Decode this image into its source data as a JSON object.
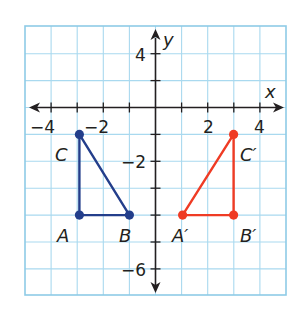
{
  "chart_data": {
    "type": "scatter",
    "title": "",
    "xlabel": "x",
    "ylabel": "y",
    "xlim": [
      -5,
      5
    ],
    "ylim": [
      -7,
      3
    ],
    "grid": true,
    "x_tick_labels": [
      {
        "value": -4,
        "text": "−4"
      },
      {
        "value": -2,
        "text": "−2"
      },
      {
        "value": 2,
        "text": "2"
      },
      {
        "value": 4,
        "text": "4"
      }
    ],
    "y_tick_labels": [
      {
        "value": 2,
        "text": "4"
      },
      {
        "value": -2,
        "text": "−2"
      },
      {
        "value": -6,
        "text": "−6"
      }
    ],
    "series": [
      {
        "name": "Triangle ABC",
        "color": "#233e8b",
        "closed": true,
        "points": [
          {
            "label": "A",
            "x": -3,
            "y": -4
          },
          {
            "label": "B",
            "x": -1,
            "y": -4
          },
          {
            "label": "C",
            "x": -3,
            "y": -1
          }
        ]
      },
      {
        "name": "Triangle A'B'C'",
        "color": "#ef3b24",
        "closed": true,
        "points": [
          {
            "label": "A′",
            "x": 1,
            "y": -4
          },
          {
            "label": "B′",
            "x": 3,
            "y": -4
          },
          {
            "label": "C′",
            "x": 3,
            "y": -1
          }
        ]
      }
    ]
  },
  "labels": {
    "x_axis": "x",
    "y_axis": "y",
    "A": "A",
    "B": "B",
    "C": "C",
    "A_prime": "A′",
    "B_prime": "B′",
    "C_prime": "C′",
    "xt_m4": "−4",
    "xt_m2": "−2",
    "xt_2": "2",
    "xt_4": "4",
    "yt_4": "4",
    "yt_m2": "−2",
    "yt_m6": "−6"
  },
  "colors": {
    "grid": "#a9d9ef",
    "grid_border": "#8ecbe7",
    "axis": "#231f20",
    "triangle_original": "#233e8b",
    "triangle_image": "#ef3b24"
  }
}
